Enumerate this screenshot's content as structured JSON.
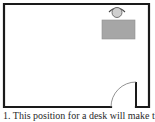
{
  "diagram": {
    "type": "floor-plan",
    "room": {
      "wall_color": "#1a1a1a",
      "floor_color": "#ffffff"
    },
    "desk": {
      "color": "#a6a6a6",
      "border": "#8c8c8c"
    },
    "person": {
      "head_color": "#cfcfcf",
      "outline": "#444444"
    },
    "door": {
      "swing": "inward-left"
    }
  },
  "caption": {
    "text": "1. This position for a desk will make the"
  }
}
